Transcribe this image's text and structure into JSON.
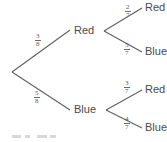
{
  "diagram": {
    "type": "probability-tree",
    "root": {
      "label": ""
    },
    "level1": [
      {
        "label": "Red",
        "probability": "3/8",
        "numerator": "3",
        "denominator": "8"
      },
      {
        "label": "Blue",
        "probability": "5/8",
        "numerator": "5",
        "denominator": "8"
      }
    ],
    "level2": [
      {
        "parent": "Red",
        "label": "Red",
        "probability": "2/7",
        "numerator": "2",
        "denominator": "7"
      },
      {
        "parent": "Red",
        "label": "Blue",
        "probability": "5/7",
        "numerator": "5",
        "denominator": "7"
      },
      {
        "parent": "Blue",
        "label": "Red",
        "probability": "3/7",
        "numerator": "3",
        "denominator": "7"
      },
      {
        "parent": "Blue",
        "label": "Blue",
        "probability": "4/7",
        "numerator": "4",
        "denominator": "7"
      }
    ],
    "colors": {
      "line": "#5f5f5f",
      "text": "#4a4a4a",
      "fraction_text": "#5a5a5a",
      "background": "#ffffff"
    }
  }
}
